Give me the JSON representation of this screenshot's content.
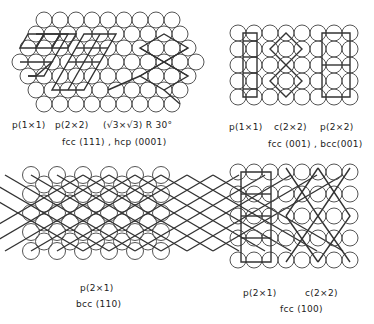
{
  "colors": {
    "stroke": "#333333",
    "background": "#ffffff",
    "text": "#222222"
  },
  "panels": [
    {
      "id": "fcc111",
      "surface_label": "fcc (111) , hcp (0001)",
      "structure_labels": [
        "p(1×1)",
        "p(2×2)",
        "(√3×√3) R 30°"
      ]
    },
    {
      "id": "fcc001",
      "surface_label": "fcc (001) , bcc(001)",
      "structure_labels": [
        "p(1×1)",
        "c(2×2)",
        "p(2×2)"
      ]
    },
    {
      "id": "bcc110",
      "surface_label": "bcc (110)",
      "structure_labels": [
        "p(2×1)"
      ]
    },
    {
      "id": "fcc100",
      "surface_label": "fcc (100)",
      "structure_labels": [
        "p(2×1)",
        "c(2×2)"
      ]
    }
  ]
}
